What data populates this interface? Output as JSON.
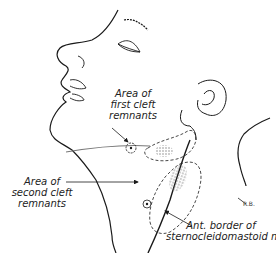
{
  "figure": {
    "colors": {
      "line": "#1a1a1a",
      "stipple": "#888888",
      "background": "#ffffff"
    }
  },
  "labels": {
    "first_cleft": {
      "line1": "Area of",
      "line2": "first cleft",
      "line3": "remnants"
    },
    "second_cleft": {
      "line1": "Area of",
      "line2": "second cleft",
      "line3": "remnants"
    },
    "scm": {
      "line1": "Ant. border of",
      "line2": "sternocleidomastoid  m."
    },
    "signature": "R.B."
  }
}
